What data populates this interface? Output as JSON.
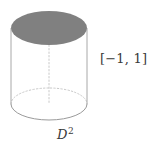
{
  "figure": {
    "name": "solid-cylinder-diagram",
    "background_color": "#ffffff"
  },
  "cylinder": {
    "top_disk": {
      "name": "top-disk",
      "fill_color": "#808080",
      "center_x": 49,
      "center_y": 28,
      "radius_x": 38,
      "radius_y": 17
    },
    "bottom_disk": {
      "name": "bottom-disk",
      "center_x": 49,
      "center_y": 104,
      "radius_x": 38,
      "radius_y": 16,
      "front_arc_color": "#9a9a9a",
      "back_arc_color": "#c8c8c8",
      "back_arc_style": "dotted"
    },
    "side_edges": {
      "name": "cylinder-side-edges",
      "color": "#a8a8a8",
      "left_x": 11,
      "right_x": 87,
      "top_y": 28,
      "bottom_y": 104
    },
    "center_axis": {
      "name": "center-axis",
      "color": "#c8c8c8",
      "style": "dotted",
      "x": 49,
      "top_y": 45,
      "bottom_y": 104
    }
  },
  "labels": {
    "interval": {
      "text": "[−1, 1]",
      "color": "#3a3a3a"
    },
    "disk": {
      "base": "D",
      "exponent": "2",
      "color": "#3a3a3a"
    }
  }
}
